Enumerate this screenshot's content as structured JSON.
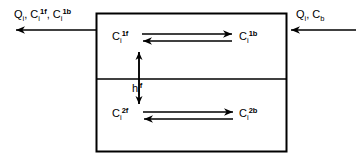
{
  "diagram": {
    "stroke_color": "#000000",
    "background_color": "#ffffff",
    "box": {
      "name": "control-volume-box",
      "divider_label": "interface-line"
    },
    "streams": {
      "outflow": {
        "label_parts": [
          "Q",
          "i",
          ", C",
          "i",
          "1f",
          ", C",
          "i",
          "1b"
        ],
        "label_text": "Qi, Ci1f, Ci1b",
        "direction": "left"
      },
      "inflow": {
        "label_parts": [
          "Q",
          "i",
          ", C",
          "i",
          "b"
        ],
        "label_text": "Qi, Cb",
        "direction": "left"
      }
    },
    "species": {
      "top_free": {
        "base": "C",
        "sub": "i",
        "sup": "1f"
      },
      "top_bound": {
        "base": "C",
        "sub": "i",
        "sup": "1b"
      },
      "bottom_free": {
        "base": "C",
        "sub": "i",
        "sup": "2f"
      },
      "bottom_bound": {
        "base": "C",
        "sub": "i",
        "sup": "2b"
      },
      "transfer_coefficient": {
        "base": "h",
        "sub": "i",
        "sup": "f"
      }
    },
    "arrows": {
      "top_forward": "C i 1f to C i 1b",
      "top_reverse": "C i 1b to C i 1f",
      "bottom_forward": "C i 2b to C i 2f",
      "bottom_reverse": "C i 2f to C i 2b",
      "vertical_exchange": "double-headed vertical transfer arrow"
    }
  }
}
